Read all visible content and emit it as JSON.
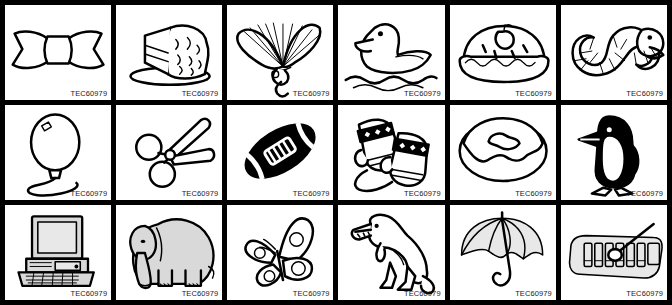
{
  "sheet": {
    "title": "Clip Art Grid Sheet",
    "columns": 6,
    "rows": 3,
    "border_color": "#000000",
    "cell_background": "#ffffff",
    "ink_color": "#000000",
    "shade_color": "#d9d9d9",
    "code_label": "TEC60979"
  },
  "cells": [
    {
      "index": 1,
      "row": 1,
      "col": 1,
      "subject": "bow",
      "label": "bow-ribbon",
      "code": "TEC60979",
      "style": "outline"
    },
    {
      "index": 2,
      "row": 1,
      "col": 2,
      "subject": "cake",
      "label": "frosted-layer-cake",
      "code": "TEC60979",
      "style": "outline"
    },
    {
      "index": 3,
      "row": 1,
      "col": 3,
      "subject": "fan",
      "label": "folding-hand-fan",
      "code": "TEC60979",
      "style": "outline"
    },
    {
      "index": 4,
      "row": 1,
      "col": 4,
      "subject": "duck",
      "label": "duck-on-water",
      "code": "TEC60979",
      "style": "outline"
    },
    {
      "index": 5,
      "row": 1,
      "col": 5,
      "subject": "pie",
      "label": "apple-pie",
      "code": "TEC60979",
      "style": "outline"
    },
    {
      "index": 6,
      "row": 1,
      "col": 6,
      "subject": "snake",
      "label": "coiled-snake",
      "code": "TEC60979",
      "style": "outline"
    },
    {
      "index": 7,
      "row": 2,
      "col": 1,
      "subject": "balloon",
      "label": "balloon-on-string",
      "code": "TEC60979",
      "style": "outline"
    },
    {
      "index": 8,
      "row": 2,
      "col": 2,
      "subject": "scissors",
      "label": "scissors",
      "code": "TEC60979",
      "style": "outline"
    },
    {
      "index": 9,
      "row": 2,
      "col": 3,
      "subject": "football",
      "label": "american-football",
      "code": "TEC60979",
      "style": "filled-black"
    },
    {
      "index": 10,
      "row": 2,
      "col": 4,
      "subject": "mittens",
      "label": "pair-of-mittens",
      "code": "TEC60979",
      "style": "outline"
    },
    {
      "index": 11,
      "row": 2,
      "col": 5,
      "subject": "donut",
      "label": "frosted-donut",
      "code": "TEC60979",
      "style": "outline"
    },
    {
      "index": 12,
      "row": 2,
      "col": 6,
      "subject": "penguin",
      "label": "penguin",
      "code": "TEC60979",
      "style": "filled-black"
    },
    {
      "index": 13,
      "row": 3,
      "col": 1,
      "subject": "computer",
      "label": "desktop-computer",
      "code": "TEC60979",
      "style": "shaded"
    },
    {
      "index": 14,
      "row": 3,
      "col": 2,
      "subject": "elephant",
      "label": "elephant",
      "code": "TEC60979",
      "style": "shaded"
    },
    {
      "index": 15,
      "row": 3,
      "col": 3,
      "subject": "butterfly",
      "label": "butterfly",
      "code": "TEC60979",
      "style": "outline"
    },
    {
      "index": 16,
      "row": 3,
      "col": 4,
      "subject": "dinosaur",
      "label": "tyrannosaurus-rex",
      "code": "TEC60979",
      "style": "outline"
    },
    {
      "index": 17,
      "row": 3,
      "col": 5,
      "subject": "umbrella",
      "label": "umbrella",
      "code": "TEC60979",
      "style": "shaded"
    },
    {
      "index": 18,
      "row": 3,
      "col": 6,
      "subject": "xylophone",
      "label": "xylophone",
      "code": "TEC60979",
      "style": "shaded"
    }
  ]
}
